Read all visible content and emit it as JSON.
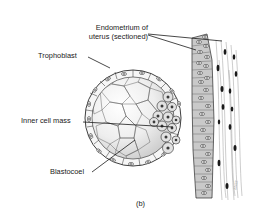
{
  "figure": {
    "caption": "(b)",
    "colors": {
      "background": "#ffffff",
      "line": "#2a2a2a",
      "cell_fill": "#f4f4f4",
      "shade": "#d2d2d2",
      "epithelium": "#c9c9c9",
      "nucleus": "#3a3a3a",
      "stroma_nucleus": "#1a1a1a"
    }
  },
  "labels": {
    "endometrium_line1": "Endometrium of",
    "endometrium_line2": "uterus (sectioned)",
    "trophoblast": "Trophoblast",
    "inner_cell_mass": "Inner cell mass",
    "blastocoel": "Blastocoel"
  }
}
